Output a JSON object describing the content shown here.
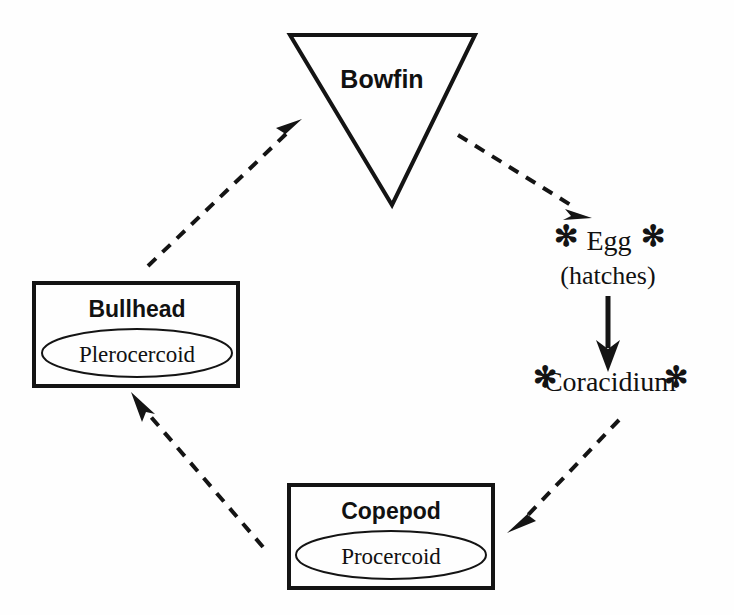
{
  "diagram": {
    "background_color": "#fefefe",
    "stroke_color": "#141414",
    "nodes": {
      "bowfin": {
        "label": "Bowfin",
        "shape": "inverted-triangle",
        "role": "definitive-host"
      },
      "egg": {
        "label": "Egg",
        "sub_label": "(hatches)",
        "asterisk_left": "✻",
        "asterisk_right": "✻",
        "shape": "text-only",
        "role": "free-stage"
      },
      "coracidium": {
        "label": "Coracidium",
        "asterisk_left": "✻",
        "asterisk_right": "✻",
        "shape": "text-only",
        "role": "free-stage"
      },
      "copepod": {
        "label": "Copepod",
        "inner_label": "Procercoid",
        "shape": "rectangle-with-ellipse",
        "role": "first-intermediate-host"
      },
      "bullhead": {
        "label": "Bullhead",
        "inner_label": "Plerocercoid",
        "shape": "rectangle-with-ellipse",
        "role": "second-intermediate-host"
      }
    },
    "links": [
      {
        "from": "bowfin",
        "to": "egg",
        "style": "dashed",
        "arrow": "single"
      },
      {
        "from": "egg",
        "to": "coracidium",
        "style": "solid",
        "arrow": "single"
      },
      {
        "from": "coracidium",
        "to": "copepod",
        "style": "dashed",
        "arrow": "single"
      },
      {
        "from": "copepod",
        "to": "bullhead",
        "style": "dashed",
        "arrow": "single"
      },
      {
        "from": "bullhead",
        "to": "bowfin",
        "style": "dashed",
        "arrow": "single"
      }
    ]
  }
}
